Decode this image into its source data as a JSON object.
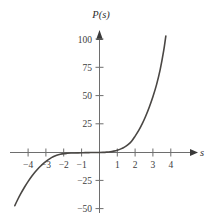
{
  "chart_data": {
    "type": "line",
    "title": "",
    "xlabel": "s",
    "ylabel": "P(s)",
    "xlim": [
      -4.95,
      5.1
    ],
    "ylim": [
      -58,
      110
    ],
    "grid": false,
    "legend": null,
    "xticks": [
      -4,
      -3,
      -2,
      -1,
      1,
      2,
      3,
      4
    ],
    "xtick_labels": [
      "−4",
      "−3",
      "−2",
      "−1",
      "1",
      "2",
      "3",
      "4"
    ],
    "yticks": [
      -50,
      -25,
      25,
      50,
      75,
      100
    ],
    "ytick_labels": [
      "−50",
      "−25",
      "25",
      "50",
      "75",
      "100"
    ],
    "series": [
      {
        "name": "P(s)",
        "color": "#4a4744",
        "x": [
          -4.75,
          -4.6,
          -4.4,
          -4.2,
          -4.0,
          -3.8,
          -3.6,
          -3.4,
          -3.2,
          -3.0,
          -2.8,
          -2.6,
          -2.4,
          -2.2,
          -2.0,
          -1.8,
          -1.6,
          -1.4,
          -1.2,
          -1.0,
          -0.8,
          -0.6,
          -0.4,
          -0.2,
          0.0,
          0.2,
          0.4,
          0.6,
          0.8,
          1.0,
          1.2,
          1.4,
          1.6,
          1.8,
          2.0,
          2.2,
          2.4,
          2.6,
          2.8,
          3.0,
          3.2,
          3.4,
          3.6,
          3.72
        ],
        "y": [
          -47.0,
          -42.0,
          -36.0,
          -30.5,
          -25.5,
          -21.0,
          -17.0,
          -13.5,
          -10.5,
          -7.8,
          -5.6,
          -3.8,
          -2.5,
          -1.6,
          -1.0,
          -0.7,
          -0.5,
          -0.4,
          -0.3,
          -0.2,
          -0.1,
          -0.1,
          0.0,
          0.0,
          0.0,
          0.1,
          0.3,
          0.6,
          1.2,
          2.0,
          3.2,
          4.8,
          7.0,
          10.0,
          14.5,
          19.5,
          25.5,
          32.5,
          40.5,
          49.5,
          60.0,
          73.0,
          90.0,
          103.0
        ]
      }
    ],
    "annotations": [],
    "axes_style": {
      "origin_x": 0,
      "origin_y": 0,
      "arrows": [
        "x-positive",
        "y-positive"
      ],
      "axis_color": "#6e6e6e",
      "spine": "crossed-at-origin"
    }
  }
}
